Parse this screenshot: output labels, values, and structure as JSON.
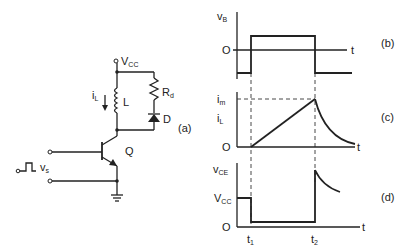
{
  "figure": {
    "circuit": {
      "panel_label": "(a)",
      "supply_label": "V",
      "supply_sub": "CC",
      "current_label": "i",
      "current_sub": "L",
      "inductor_label": "L",
      "resistor_label": "R",
      "resistor_sub": "d",
      "diode_label": "D",
      "transistor_label": "Q",
      "source_label": "v",
      "source_sub": "s"
    },
    "waveform_b": {
      "panel_label": "(b)",
      "y_label": "v",
      "y_sub": "B",
      "zero_label": "O",
      "t_label": "t"
    },
    "waveform_c": {
      "panel_label": "(c)",
      "peak_label": "i",
      "peak_sub": "m",
      "y_label": "i",
      "y_sub": "L",
      "zero_label": "O",
      "t_label": "t"
    },
    "waveform_d": {
      "panel_label": "(d)",
      "y_label": "v",
      "y_sub": "CE",
      "vcc_label": "V",
      "vcc_sub": "CC",
      "zero_label": "O",
      "t_label": "t",
      "t1_label": "t",
      "t1_sub": "1",
      "t2_label": "t",
      "t2_sub": "2"
    }
  }
}
